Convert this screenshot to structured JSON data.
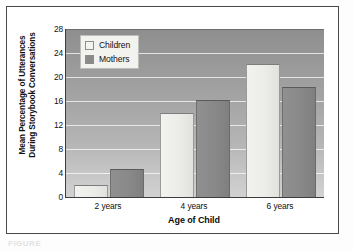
{
  "figure": {
    "caption": "FIGURE"
  },
  "chart_data": {
    "type": "bar",
    "title": "",
    "xlabel": "Age of Child",
    "ylabel": "Mean Percentage of Utterances During Storybook Conversations",
    "ylabel_lines": [
      "Mean Percentage of Utterances",
      "During Storybook Conversations"
    ],
    "categories": [
      "2 years",
      "4 years",
      "6 years"
    ],
    "series": [
      {
        "name": "Children",
        "values": [
          2.0,
          14.0,
          22.2
        ],
        "color": "#eeeeea"
      },
      {
        "name": "Mothers",
        "values": [
          4.7,
          16.2,
          18.4
        ],
        "color": "#8a8a8a"
      }
    ],
    "ylim": [
      0,
      28
    ],
    "yticks": [
      0,
      4,
      8,
      12,
      16,
      20,
      24,
      28
    ],
    "ytick_labels": [
      "0",
      "4",
      "8",
      "12",
      "16",
      "20",
      "24",
      "28"
    ],
    "grid": true,
    "grid_color": "#ffffff",
    "legend_position": "top-left",
    "plot_background": "gray-gradient",
    "frame_color": "#4a4a4a"
  }
}
